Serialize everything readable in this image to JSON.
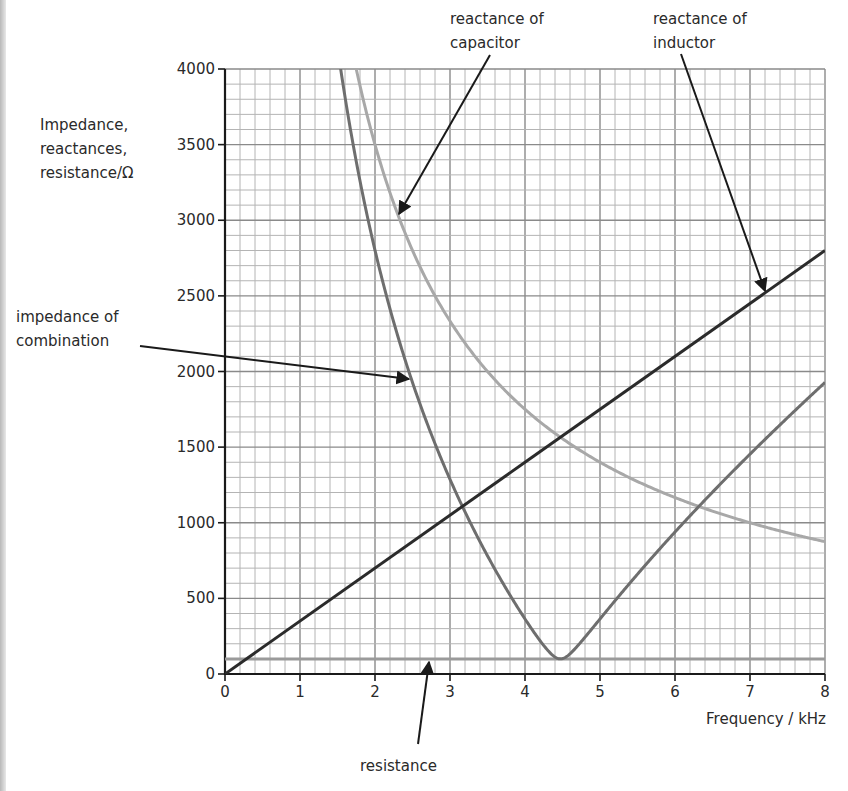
{
  "header": {
    "cut_title": ""
  },
  "chart_data": {
    "type": "line",
    "title": "",
    "xlabel": "Frequency / kHz",
    "ylabel": "Impedance, reactances, resistance/Ω",
    "ylabel_lines": [
      "Impedance,",
      "reactances,",
      "resistance/Ω"
    ],
    "xlim": [
      0,
      8
    ],
    "ylim": [
      0,
      4000
    ],
    "x_ticks": [
      0,
      1,
      2,
      3,
      4,
      5,
      6,
      7,
      8
    ],
    "y_ticks": [
      0,
      500,
      1000,
      1500,
      2000,
      2500,
      3000,
      3500,
      4000
    ],
    "grid": {
      "major_x": 1,
      "minor_x": 0.2,
      "major_y": 500,
      "minor_y": 100
    },
    "series": [
      {
        "name": "reactance of inductor",
        "kind": "linear",
        "slope_ohm_per_khz": 350,
        "x": [
          0,
          8
        ],
        "values": [
          0,
          2800
        ],
        "color": "#2b2b2b"
      },
      {
        "name": "reactance of capacitor",
        "kind": "reciprocal",
        "k_ohm_khz": 7000,
        "x": [
          1.75,
          2,
          3,
          4,
          4.5,
          5,
          6,
          7,
          8
        ],
        "values": [
          4000,
          3500,
          2333,
          1750,
          1556,
          1400,
          1167,
          1000,
          875
        ],
        "color": "#a8a8a8"
      },
      {
        "name": "resistance",
        "kind": "constant",
        "x": [
          0,
          8
        ],
        "values": [
          100,
          100
        ],
        "color": "#9a9a9a"
      },
      {
        "name": "impedance of combination",
        "kind": "sqrt(R^2+(XL-XC)^2)",
        "x": [
          1.5,
          2,
          2.5,
          3,
          3.5,
          4,
          4.47,
          5,
          6,
          7,
          8
        ],
        "values": [
          4142,
          2801,
          1926,
          1284,
          775,
          351,
          100,
          352,
          1001,
          1551,
          2027
        ],
        "color": "#6e6e6e"
      }
    ],
    "annotations": [
      {
        "text_lines": [
          "reactance of",
          "capacitor"
        ],
        "target": "reactance of capacitor"
      },
      {
        "text_lines": [
          "reactance of",
          "inductor"
        ],
        "target": "reactance of inductor"
      },
      {
        "text_lines": [
          "impedance of",
          "combination"
        ],
        "target": "impedance of combination"
      },
      {
        "text_lines": [
          "resistance"
        ],
        "target": "resistance"
      }
    ],
    "legend": "none (arrow annotations)"
  }
}
